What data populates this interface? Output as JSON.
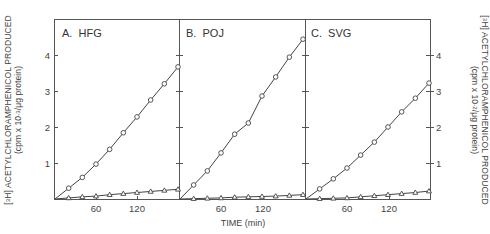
{
  "chart_data": [
    {
      "type": "line",
      "panel": "A",
      "title": "A.  HFG",
      "xlabel": "",
      "ylabel": "[3H] ACETYLCHLORAMPHENICOL PRODUCED (cpm x 10-3/μg protein)",
      "x_ticks": [
        60,
        120
      ],
      "y_ticks": [
        1,
        2,
        3,
        4
      ],
      "xlim": [
        0,
        180
      ],
      "ylim": [
        0,
        5
      ],
      "grid": false,
      "series": [
        {
          "name": "circles",
          "marker": "circle",
          "x": [
            20,
            40,
            60,
            80,
            100,
            120,
            140,
            160,
            180
          ],
          "values": [
            0.3,
            0.6,
            0.97,
            1.38,
            1.84,
            2.28,
            2.75,
            3.2,
            3.67
          ]
        },
        {
          "name": "triangles",
          "marker": "triangle",
          "x": [
            20,
            40,
            60,
            80,
            100,
            120,
            140,
            160,
            180
          ],
          "values": [
            0.03,
            0.06,
            0.08,
            0.12,
            0.15,
            0.18,
            0.21,
            0.24,
            0.27
          ]
        }
      ]
    },
    {
      "type": "line",
      "panel": "B",
      "title": "B.  POJ",
      "xlabel": "TIME (min)",
      "x_ticks": [
        60,
        120
      ],
      "xlim": [
        0,
        180
      ],
      "ylim": [
        0,
        5
      ],
      "grid": false,
      "series": [
        {
          "name": "circles",
          "marker": "circle",
          "x": [
            20,
            40,
            60,
            80,
            100,
            120,
            140,
            160,
            180
          ],
          "values": [
            0.39,
            0.78,
            1.28,
            1.8,
            2.11,
            2.86,
            3.39,
            3.94,
            4.44
          ]
        },
        {
          "name": "triangles",
          "marker": "triangle",
          "x": [
            20,
            40,
            60,
            80,
            100,
            120,
            140,
            160,
            180
          ],
          "values": [
            0.01,
            0.02,
            0.03,
            0.05,
            0.06,
            0.07,
            0.08,
            0.1,
            0.12
          ]
        }
      ]
    },
    {
      "type": "line",
      "panel": "C",
      "title": "C.  SVG",
      "xlabel": "",
      "ylabel": "[3H] ACETYLCHLORAMPHENICOL PRODUCED (cpm x 10-2/μg protein)",
      "x_ticks": [
        60,
        120
      ],
      "y_ticks": [
        1,
        2,
        3,
        4
      ],
      "xlim": [
        0,
        180
      ],
      "ylim": [
        0,
        5
      ],
      "grid": false,
      "series": [
        {
          "name": "circles",
          "marker": "circle",
          "x": [
            20,
            40,
            60,
            80,
            100,
            120,
            140,
            160,
            180
          ],
          "values": [
            0.28,
            0.56,
            0.86,
            1.22,
            1.58,
            2.0,
            2.42,
            2.8,
            3.22
          ]
        },
        {
          "name": "triangles",
          "marker": "triangle",
          "x": [
            20,
            40,
            60,
            80,
            100,
            120,
            140,
            160,
            180
          ],
          "values": [
            0.01,
            0.02,
            0.03,
            0.06,
            0.09,
            0.12,
            0.15,
            0.18,
            0.22
          ]
        }
      ]
    }
  ],
  "labels": {
    "panel_a": "A.  HFG",
    "panel_b": "B.  POJ",
    "panel_c": "C.  SVG",
    "x_axis": "TIME (min)",
    "y_left_main": "ACETYLCHLORAMPHENICOL PRODUCED",
    "y_left_prefix": "[",
    "y_left_iso_num": "3",
    "y_left_iso_el": "H]",
    "y_left_unit_a": "(cpm x 10",
    "y_left_unit_exp": "-3",
    "y_left_unit_b": "/μg protein)",
    "y_right_main": "ACETYLCHLORAMPHENICOL PRODUCED",
    "y_right_prefix": "[",
    "y_right_iso_num": "3",
    "y_right_iso_el": "H]",
    "y_right_unit_a": "(cpm x 10",
    "y_right_unit_exp": "-2",
    "y_right_unit_b": "/μg protein)",
    "x_tick_60": "60",
    "x_tick_120": "120",
    "y_tick_1": "1",
    "y_tick_2": "2",
    "y_tick_3": "3",
    "y_tick_4": "4"
  }
}
